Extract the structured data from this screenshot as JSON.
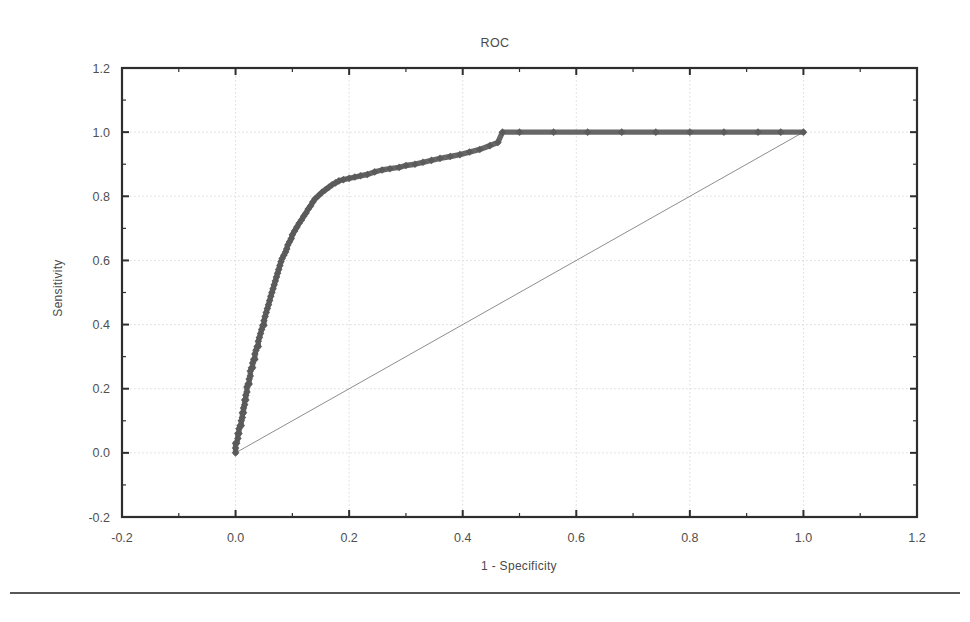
{
  "chart_data": {
    "type": "line",
    "title": "ROC",
    "xlabel": "1 - Specificity",
    "ylabel": "Sensitivity",
    "xlim": [
      -0.2,
      1.2
    ],
    "ylim": [
      -0.2,
      1.2
    ],
    "xticks": [
      -0.2,
      0.0,
      0.2,
      0.4,
      0.6,
      0.8,
      1.0,
      1.2
    ],
    "yticks": [
      -0.2,
      0.0,
      0.2,
      0.4,
      0.6,
      0.8,
      1.0,
      1.2
    ],
    "xtick_labels": [
      "-0.2",
      "0.0",
      "0.2",
      "0.4",
      "0.6",
      "0.8",
      "1.0",
      "1.2"
    ],
    "ytick_labels": [
      "-0.2",
      "0.0",
      "0.2",
      "0.4",
      "0.6",
      "0.8",
      "1.0",
      "1.2"
    ],
    "minor_ticks": true,
    "grid": true,
    "grid_style": "dotted",
    "legend": null,
    "series": [
      {
        "name": "ROC curve",
        "type": "line",
        "color": "#5b5b5b",
        "marker": "diamond",
        "x": [
          0.0,
          0.0,
          0.0,
          0.002,
          0.004,
          0.004,
          0.006,
          0.006,
          0.008,
          0.01,
          0.01,
          0.012,
          0.012,
          0.014,
          0.014,
          0.016,
          0.016,
          0.018,
          0.018,
          0.02,
          0.02,
          0.022,
          0.024,
          0.024,
          0.026,
          0.026,
          0.028,
          0.03,
          0.03,
          0.032,
          0.034,
          0.034,
          0.036,
          0.038,
          0.04,
          0.04,
          0.042,
          0.044,
          0.046,
          0.048,
          0.05,
          0.05,
          0.052,
          0.054,
          0.056,
          0.058,
          0.06,
          0.062,
          0.064,
          0.066,
          0.068,
          0.07,
          0.072,
          0.074,
          0.076,
          0.078,
          0.08,
          0.082,
          0.085,
          0.088,
          0.09,
          0.092,
          0.095,
          0.098,
          0.1,
          0.104,
          0.108,
          0.112,
          0.116,
          0.12,
          0.124,
          0.128,
          0.132,
          0.136,
          0.14,
          0.146,
          0.152,
          0.158,
          0.164,
          0.17,
          0.176,
          0.182,
          0.19,
          0.2,
          0.21,
          0.22,
          0.232,
          0.245,
          0.258,
          0.272,
          0.288,
          0.3,
          0.316,
          0.33,
          0.345,
          0.36,
          0.378,
          0.395,
          0.412,
          0.43,
          0.448,
          0.462,
          0.47,
          0.5,
          0.56,
          0.62,
          0.68,
          0.74,
          0.8,
          0.86,
          0.92,
          0.96,
          1.0
        ],
        "y": [
          0.0,
          0.015,
          0.03,
          0.03,
          0.045,
          0.06,
          0.06,
          0.075,
          0.085,
          0.085,
          0.1,
          0.11,
          0.125,
          0.125,
          0.14,
          0.15,
          0.165,
          0.165,
          0.18,
          0.19,
          0.205,
          0.215,
          0.215,
          0.23,
          0.24,
          0.255,
          0.265,
          0.265,
          0.28,
          0.292,
          0.292,
          0.308,
          0.32,
          0.332,
          0.332,
          0.348,
          0.36,
          0.372,
          0.385,
          0.398,
          0.398,
          0.412,
          0.425,
          0.438,
          0.45,
          0.462,
          0.475,
          0.488,
          0.5,
          0.512,
          0.524,
          0.536,
          0.548,
          0.56,
          0.572,
          0.584,
          0.596,
          0.606,
          0.616,
          0.626,
          0.636,
          0.648,
          0.658,
          0.668,
          0.68,
          0.692,
          0.704,
          0.716,
          0.726,
          0.738,
          0.748,
          0.76,
          0.77,
          0.782,
          0.792,
          0.802,
          0.812,
          0.82,
          0.828,
          0.836,
          0.842,
          0.848,
          0.852,
          0.856,
          0.86,
          0.864,
          0.868,
          0.876,
          0.882,
          0.886,
          0.89,
          0.896,
          0.9,
          0.906,
          0.912,
          0.918,
          0.924,
          0.93,
          0.938,
          0.946,
          0.958,
          0.968,
          1.0,
          1.0,
          1.0,
          1.0,
          1.0,
          1.0,
          1.0,
          1.0,
          1.0,
          1.0,
          1.0
        ]
      },
      {
        "name": "reference diagonal",
        "type": "line",
        "color": "#8e8e8e",
        "marker": "none",
        "x": [
          0.0,
          1.0
        ],
        "y": [
          0.0,
          1.0
        ]
      }
    ]
  },
  "figure": {
    "title": "ROC",
    "xlabel": "1 - Specificity",
    "ylabel": "Sensitivity",
    "background": "#ffffff",
    "curve_color": "#5b5b5b",
    "reference_color": "#8e8e8e",
    "frame_color": "#2e2e2e",
    "grid_color": "#d9d9d9"
  },
  "footer": {
    "rule": "horizontal-rule"
  }
}
